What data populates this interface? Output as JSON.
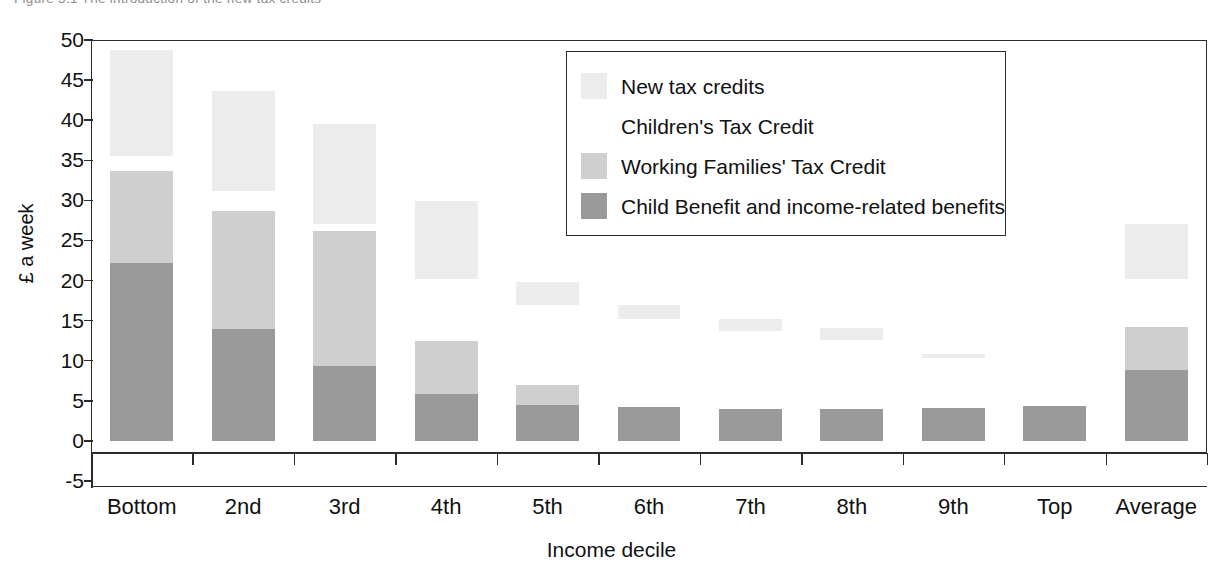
{
  "caption": "Figure 5.1   The introduction of the new tax credits",
  "legend": {
    "position": "inside-top-right",
    "items": [
      {
        "label": "New tax credits",
        "color": "#ececec"
      },
      {
        "label": "Children's Tax Credit",
        "color": "#ffffff"
      },
      {
        "label": "Working Families' Tax Credit",
        "color": "#cfcfcf"
      },
      {
        "label": "Child Benefit and income-related benefits",
        "color": "#9a9a9a"
      }
    ]
  },
  "chart_data": {
    "type": "bar",
    "stacked": true,
    "title": "The introduction of the new tax credits",
    "xlabel": "Income decile",
    "ylabel": "£ a week",
    "ylim": [
      -5,
      50
    ],
    "yticks": [
      50,
      45,
      40,
      35,
      30,
      25,
      20,
      15,
      10,
      5,
      0,
      -5
    ],
    "grid": false,
    "categories": [
      "Bottom",
      "2nd",
      "3rd",
      "4th",
      "5th",
      "6th",
      "7th",
      "8th",
      "9th",
      "Top",
      "Average"
    ],
    "series": [
      {
        "name": "Child Benefit and income-related benefits",
        "color": "#9a9a9a",
        "values": [
          22.2,
          13.9,
          9.4,
          5.8,
          4.5,
          4.2,
          4.0,
          4.0,
          4.1,
          4.4,
          8.9
        ]
      },
      {
        "name": "Working Families' Tax Credit",
        "color": "#cfcfcf",
        "values": [
          11.5,
          14.8,
          16.8,
          6.6,
          2.5,
          0.0,
          0.0,
          0.0,
          0.0,
          0.0,
          5.3
        ]
      },
      {
        "name": "Children's Tax Credit",
        "color": "#ffffff",
        "values": [
          1.8,
          2.5,
          0.8,
          7.8,
          10.0,
          11.0,
          9.7,
          8.6,
          6.2,
          0.0,
          6.0
        ]
      },
      {
        "name": "New tax credits",
        "color": "#ececec",
        "values": [
          13.3,
          12.4,
          12.5,
          9.7,
          2.8,
          1.8,
          1.5,
          1.5,
          0.6,
          0.0,
          6.8
        ]
      }
    ],
    "stack_tops": {
      "Bottom": [
        22.2,
        33.7,
        35.5,
        48.8
      ],
      "2nd": [
        13.9,
        28.7,
        31.2,
        43.6
      ],
      "3rd": [
        9.4,
        26.2,
        27.0,
        39.5
      ],
      "4th": [
        5.8,
        12.4,
        20.2,
        29.9
      ],
      "5th": [
        4.5,
        7.0,
        17.0,
        19.8
      ],
      "6th": [
        4.2,
        4.2,
        15.2,
        17.0
      ],
      "7th": [
        4.0,
        4.0,
        13.7,
        15.2
      ],
      "8th": [
        4.0,
        4.0,
        12.6,
        14.1
      ],
      "9th": [
        4.1,
        4.1,
        10.3,
        10.9
      ],
      "Top": [
        4.4,
        4.4,
        4.4,
        4.4
      ],
      "Average": [
        8.9,
        14.2,
        20.2,
        27.0
      ]
    }
  }
}
